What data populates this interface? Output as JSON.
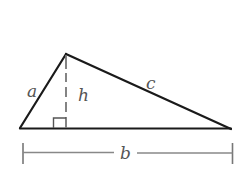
{
  "diagram": {
    "type": "triangle-area",
    "labels": {
      "side_a": "a",
      "side_c": "c",
      "height": "h",
      "base": "b"
    },
    "colors": {
      "stroke": "#1a1a1a",
      "dimension": "#777777",
      "label": "#555555"
    },
    "vertices": {
      "left": [
        20,
        128
      ],
      "apex": [
        66,
        54
      ],
      "right": [
        231,
        129
      ]
    }
  }
}
